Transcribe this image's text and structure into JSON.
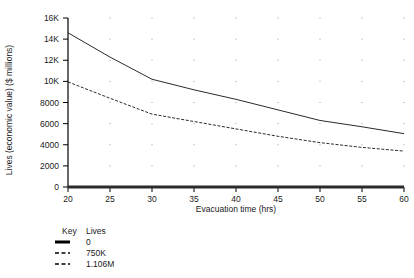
{
  "chart_data": {
    "type": "line",
    "title": "",
    "xlabel": "Evacuation time (hrs)",
    "ylabel": "Lives (economic value) ($ millions)",
    "xlim": [
      20,
      60
    ],
    "ylim": [
      0,
      16000
    ],
    "xticks": [
      20,
      25,
      30,
      35,
      40,
      45,
      50,
      55,
      60
    ],
    "xtick_labels": [
      "20",
      "25",
      "30",
      "35",
      "40",
      "45",
      "50",
      "55",
      "60"
    ],
    "yticks": [
      0,
      2000,
      4000,
      6000,
      8000,
      10000,
      12000,
      14000,
      16000
    ],
    "ytick_labels": [
      "0",
      "2000",
      "4000",
      "6000",
      "8000",
      "10K",
      "12K",
      "14K",
      "16K"
    ],
    "grid": "dotted-points",
    "legend_position": "below-left",
    "legend_headers": [
      "Key",
      "Lives"
    ],
    "x": [
      20,
      25,
      30,
      35,
      40,
      45,
      50,
      55,
      60
    ],
    "series": [
      {
        "name": "0",
        "style": "solid-thick",
        "values": [
          0,
          0,
          0,
          0,
          0,
          0,
          0,
          0,
          0
        ]
      },
      {
        "name": "750K",
        "style": "solid",
        "values": [
          14600,
          12300,
          10200,
          9200,
          8300,
          7300,
          6300,
          5700,
          5050
        ]
      },
      {
        "name": "1.106M",
        "style": "dashed",
        "values": [
          9950,
          8400,
          6900,
          6200,
          5500,
          4800,
          4200,
          3750,
          3400
        ]
      }
    ]
  },
  "axes": {
    "y_title": "Lives (economic value) ($ millions)",
    "x_title": "Evacuation time (hrs)"
  },
  "legend": {
    "header_key": "Key",
    "header_value": "Lives",
    "rows": [
      {
        "label": "0",
        "style": "solid-thick"
      },
      {
        "label": "750K",
        "style": "dashed"
      },
      {
        "label": "1.106M",
        "style": "dashed"
      }
    ]
  },
  "colors": {
    "line": "#2b2b2b",
    "axis": "#000000",
    "grid_dot": "#9a9a9a",
    "background": "#ffffff"
  }
}
